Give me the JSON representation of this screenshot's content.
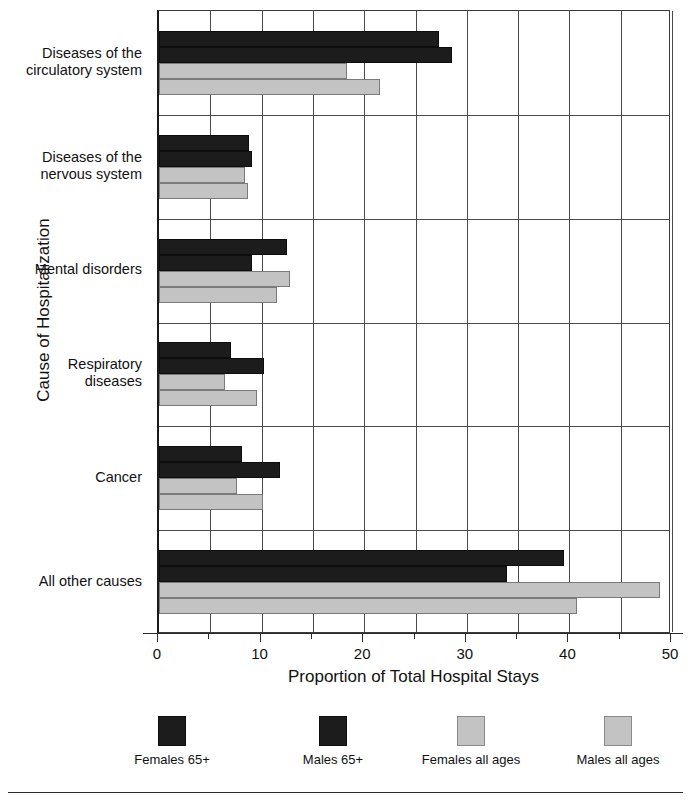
{
  "chart_data": {
    "type": "bar",
    "orientation": "horizontal",
    "title": "",
    "xlabel": "Proportion of Total Hospital Stays",
    "ylabel": "Cause of Hospitalization",
    "xlim": [
      0,
      50
    ],
    "xticks": [
      0,
      10,
      20,
      30,
      40,
      50
    ],
    "xtick_labels": [
      "0",
      "10",
      "20",
      "30",
      "40",
      "50"
    ],
    "xminor_ticks": [
      5,
      15,
      25,
      35,
      45
    ],
    "grid": true,
    "grid_axis": "x",
    "legend_position": "bottom",
    "categories": [
      "Diseases of the circulatory system",
      "Diseases of the nervous system",
      "Mental disorders",
      "Respiratory diseases",
      "Cancer",
      "All other causes"
    ],
    "category_lines": [
      [
        "Diseases of the",
        "circulatory system"
      ],
      [
        "Diseases of the",
        "nervous system"
      ],
      [
        "Mental disorders"
      ],
      [
        "Respiratory",
        "diseases"
      ],
      [
        "Cancer"
      ],
      [
        "All other causes"
      ]
    ],
    "series": [
      {
        "name": "Females 65+",
        "color": "#1c1c1c",
        "values": [
          27.3,
          8.8,
          12.5,
          7.0,
          8.1,
          39.5
        ]
      },
      {
        "name": "Males 65+",
        "color": "#1c1c1c",
        "values": [
          28.6,
          9.1,
          9.1,
          10.2,
          11.8,
          33.9
        ]
      },
      {
        "name": "Females all ages",
        "color": "#c3c3c3",
        "values": [
          18.3,
          8.4,
          12.8,
          6.4,
          7.6,
          48.8
        ]
      },
      {
        "name": "Males all ages",
        "color": "#c3c3c3",
        "values": [
          21.5,
          8.7,
          11.5,
          9.6,
          10.1,
          40.7
        ]
      }
    ]
  },
  "legend": {
    "items": [
      {
        "label": "Females 65+",
        "swatch": "dark"
      },
      {
        "label": "Males 65+",
        "swatch": "dark"
      },
      {
        "label": "Females all ages",
        "swatch": "light"
      },
      {
        "label": "Males all ages",
        "swatch": "light"
      }
    ]
  },
  "axes": {
    "x_title": "Proportion of Total Hospital Stays",
    "y_title": "Cause of Hospitalization"
  }
}
